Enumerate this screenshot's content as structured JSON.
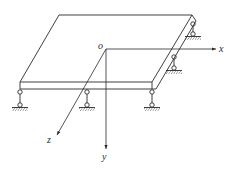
{
  "diagram": {
    "labels": {
      "origin": "o",
      "x_axis": "x",
      "y_axis": "y",
      "z_axis": "z"
    },
    "colors": {
      "line": "#2a2a2a",
      "background": "#ffffff"
    },
    "supports": {
      "front_edge_count": 3,
      "right_edge_count": 2
    }
  }
}
